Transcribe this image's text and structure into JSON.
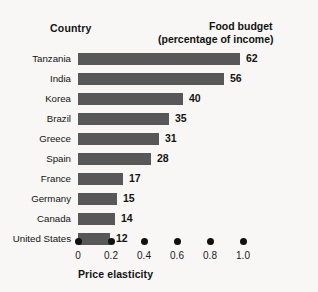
{
  "chart_data": {
    "type": "bar",
    "orientation": "horizontal",
    "title": "",
    "header_left": "Country",
    "header_right_line1": "Food budget",
    "header_right_line2": "(percentage of income)",
    "xlabel": "Price elasticity",
    "ylabel": "Country",
    "value_axis_label": "Food budget (percentage of income)",
    "categories": [
      "Tanzania",
      "India",
      "Korea",
      "Brazil",
      "Greece",
      "Spain",
      "France",
      "Germany",
      "Canada",
      "United States"
    ],
    "values": [
      62,
      56,
      40,
      35,
      31,
      28,
      17,
      15,
      14,
      12
    ],
    "value_suffix": "",
    "x_ticks": [
      "0",
      "0.2",
      "0.4",
      "0.6",
      "0.8",
      "1.0"
    ],
    "x_tick_values": [
      0,
      0.2,
      0.4,
      0.6,
      0.8,
      1.0
    ],
    "xlim": [
      0,
      1.0
    ],
    "price_elasticity": [
      0.77,
      0.67,
      0.62,
      0.56,
      0.49,
      0.44,
      0.35,
      0.32,
      0.31,
      0.27
    ],
    "grid": false,
    "legend": "none",
    "bar_color": "#585858",
    "background_color": "#f8f7f5",
    "text_color": "#131313",
    "tick_marker": "dot"
  },
  "axis": {
    "title": "Price elasticity",
    "ticks": [
      {
        "label": "0",
        "x": 78
      },
      {
        "label": "0.2",
        "x": 111
      },
      {
        "label": "0.4",
        "x": 144
      },
      {
        "label": "0.6",
        "x": 177
      },
      {
        "label": "0.8",
        "x": 210
      },
      {
        "label": "1.0",
        "x": 243
      }
    ]
  },
  "header": {
    "left": "Country",
    "right_line1": "Food budget",
    "right_line2": "(percentage of income)"
  },
  "rows": [
    {
      "country": "Tanzania",
      "value": "62",
      "width": 162
    },
    {
      "country": "India",
      "value": "56",
      "width": 146
    },
    {
      "country": "Korea",
      "value": "40",
      "width": 105
    },
    {
      "country": "Brazil",
      "value": "35",
      "width": 91
    },
    {
      "country": "Greece",
      "value": "31",
      "width": 81
    },
    {
      "country": "Spain",
      "value": "28",
      "width": 73
    },
    {
      "country": "France",
      "value": "17",
      "width": 45
    },
    {
      "country": "Germany",
      "value": "15",
      "width": 39
    },
    {
      "country": "Canada",
      "value": "14",
      "width": 37
    },
    {
      "country": "United States",
      "value": "12",
      "width": 32
    }
  ]
}
